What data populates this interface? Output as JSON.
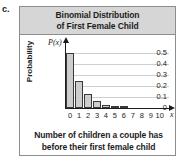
{
  "item_label": "c.",
  "figure": {
    "title_lines": [
      "Binomial Distribution",
      "of First Female Child"
    ],
    "caption_lines": [
      "Number of children a couple has",
      "before their first female child"
    ]
  },
  "colors": {
    "title_band": "#d6d6d6",
    "bar_fill": "#cdcdcd",
    "bar_stroke": "#3a3a3a",
    "gridline": "#cfcfcf",
    "axis": "#1d1d1d",
    "box_border": "#8d8d8d"
  },
  "chart_data": {
    "type": "bar",
    "title": "Binomial Distribution of First Female Child",
    "xlabel": "Number of children a couple has before their first female child",
    "ylabel": "Probability",
    "x_axis_variable": "x",
    "y_axis_variable": "P(x)",
    "categories": [
      "0",
      "1",
      "2",
      "3",
      "4",
      "5",
      "6",
      "7",
      "8",
      "9",
      "10"
    ],
    "values": [
      0.5,
      0.25,
      0.125,
      0.0625,
      0.031,
      0.016,
      0.008,
      0.004,
      0.002,
      0.001,
      0.0005
    ],
    "y_tick_labels": [
      "0.5",
      "0.4",
      "0.3",
      "0.2",
      "0.1",
      "0"
    ],
    "y_tick_values": [
      0.5,
      0.4,
      0.3,
      0.2,
      0.1,
      0
    ],
    "ylim": [
      0,
      0.55
    ],
    "xlim": [
      0,
      10
    ],
    "grid": true,
    "legend": false
  }
}
